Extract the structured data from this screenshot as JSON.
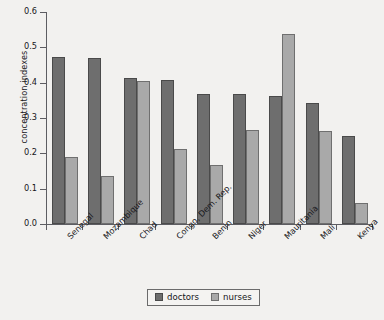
{
  "chart_data": {
    "type": "bar",
    "title": "",
    "xlabel": "",
    "ylabel": "concentration indexes",
    "ylim": [
      0.0,
      0.6
    ],
    "ytick_labels": [
      "0.0",
      "0.1",
      "0.2",
      "0.3",
      "0.4",
      "0.5",
      "0.6"
    ],
    "ytick_values": [
      0.0,
      0.1,
      0.2,
      0.3,
      0.4,
      0.5,
      0.6
    ],
    "grid": false,
    "legend_position": "bottom-center",
    "categories": [
      "Senegal",
      "Mozambique",
      "Chad",
      "Congo, Dem. Rep.",
      "Benin",
      "Niger",
      "Mauritania",
      "Mali",
      "Kenya"
    ],
    "series": [
      {
        "name": "doctors",
        "color": "#6e6e6e",
        "values": [
          0.472,
          0.47,
          0.412,
          0.409,
          0.368,
          0.368,
          0.363,
          0.343,
          0.25
        ]
      },
      {
        "name": "nurses",
        "color": "#a9a9a9",
        "values": [
          0.19,
          0.136,
          0.405,
          0.211,
          0.167,
          0.265,
          0.538,
          0.262,
          0.06
        ]
      }
    ]
  },
  "legend": {
    "items": [
      {
        "label": "doctors"
      },
      {
        "label": "nurses"
      }
    ]
  }
}
